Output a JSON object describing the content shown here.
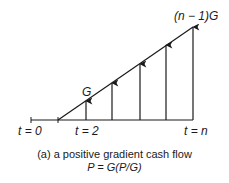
{
  "diagram": {
    "labels": {
      "t0": "t = 0",
      "t2": "t = 2",
      "tn": "t = n",
      "g": "G",
      "n_minus_1_g": "(n − 1)G"
    },
    "caption": {
      "line1": "(a) a positive gradient cash flow",
      "line2": "P = G(P/G)"
    },
    "arrows": [
      {
        "period": 2,
        "label": "G"
      },
      {
        "period": 3
      },
      {
        "period": 4
      },
      {
        "period": 5
      },
      {
        "period": "n",
        "label": "(n − 1)G"
      }
    ],
    "colors": {
      "line": "#1a1a1a",
      "background": "#ffffff"
    }
  }
}
